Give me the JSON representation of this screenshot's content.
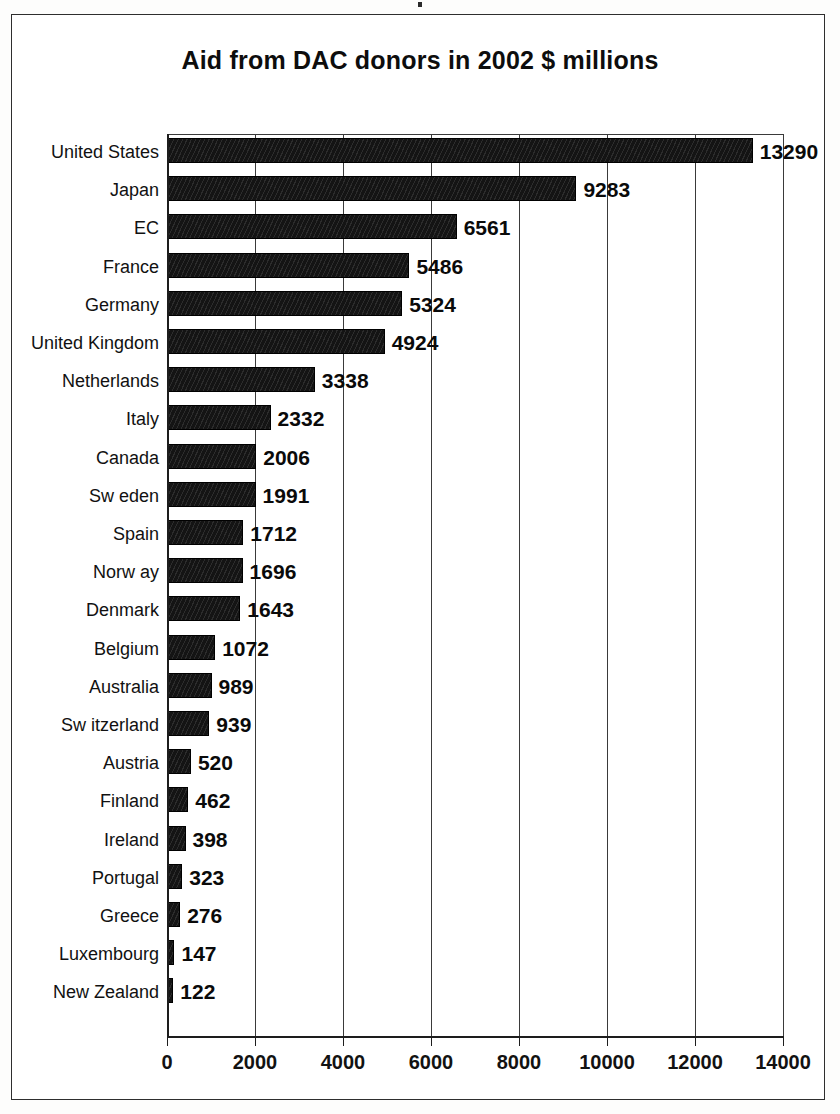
{
  "chart_data": {
    "type": "bar",
    "orientation": "horizontal",
    "title": "Aid from DAC donors in 2002 $ millions",
    "xlabel": "",
    "ylabel": "",
    "xlim": [
      0,
      14000
    ],
    "xticks": [
      0,
      2000,
      4000,
      6000,
      8000,
      10000,
      12000,
      14000
    ],
    "xtick_labels": [
      "0",
      "2000",
      "4000",
      "6000",
      "8000",
      "10000",
      "12000",
      "14000"
    ],
    "grid": "vertical",
    "legend": "none",
    "bar_color": "#141414",
    "categories": [
      "United States",
      "Japan",
      "EC",
      "France",
      "Germany",
      "United Kingdom",
      "Netherlands",
      "Italy",
      "Canada",
      "Sw eden",
      "Spain",
      "Norw ay",
      "Denmark",
      "Belgium",
      "Australia",
      "Sw itzerland",
      "Austria",
      "Finland",
      "Ireland",
      "Portugal",
      "Greece",
      "Luxembourg",
      "New  Zealand"
    ],
    "values": [
      13290,
      9283,
      6561,
      5486,
      5324,
      4924,
      3338,
      2332,
      2006,
      1991,
      1712,
      1696,
      1643,
      1072,
      989,
      939,
      520,
      462,
      398,
      323,
      276,
      147,
      122
    ],
    "data_labels": [
      "13290",
      "9283",
      "6561",
      "5486",
      "5324",
      "4924",
      "3338",
      "2332",
      "2006",
      "1991",
      "1712",
      "1696",
      "1643",
      "1072",
      "989",
      "939",
      "520",
      "462",
      "398",
      "323",
      "276",
      "147",
      "122"
    ]
  }
}
